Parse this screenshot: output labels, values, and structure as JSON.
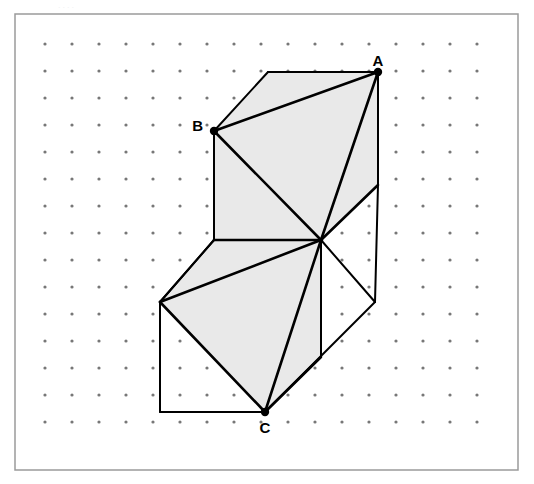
{
  "page": {
    "width": 534,
    "height": 484,
    "background_color": "#ffffff",
    "cropped_header_text": "...."
  },
  "frame": {
    "x": 15,
    "y": 14,
    "width": 503,
    "height": 456,
    "stroke_color": "#9a9a9a",
    "fill_color": "#ffffff",
    "stroke_width": 1.5
  },
  "dot_grid": {
    "origin_x": 45,
    "origin_y": 44,
    "spacing": 27,
    "columns": 17,
    "rows": 15,
    "dot_radius": 1.6,
    "dot_color": "#777777"
  },
  "figure": {
    "line_color": "#000000",
    "shade_color": "#e9e9e9",
    "thin_stroke": 2,
    "thick_stroke": 2.6,
    "vertex_dot_radius": 4.2,
    "points": {
      "A": {
        "x": 378,
        "y": 72
      },
      "B": {
        "x": 214,
        "y": 131
      },
      "C": {
        "x": 265,
        "y": 412
      },
      "M": {
        "x": 321,
        "y": 240
      },
      "topBackLeft": {
        "x": 268,
        "y": 72
      },
      "upperFrontLeftBottom": {
        "x": 214,
        "y": 240
      },
      "upperRightLowerBack": {
        "x": 378,
        "y": 185
      },
      "stepLeftTop": {
        "x": 160,
        "y": 302
      },
      "lowerFrontBottomLeft": {
        "x": 160,
        "y": 412
      },
      "lowerRightBack": {
        "x": 375,
        "y": 302
      },
      "lowerRightBackTop": {
        "x": 375,
        "y": 185
      },
      "lowerBottomRight": {
        "x": 321,
        "y": 357
      }
    },
    "shaded_faces": [
      {
        "name": "upper-top-triangle",
        "polygon": "378,72 268,72 214,131"
      },
      {
        "name": "upper-front-triangle",
        "polygon": "214,131 321,240 214,240"
      },
      {
        "name": "upper-right-triangle",
        "polygon": "378,72 321,240 378,185"
      },
      {
        "name": "upper-diagonal-face",
        "polygon": "378,72 214,131 321,240"
      },
      {
        "name": "lower-top-triangle",
        "polygon": "321,240 214,240 160,302"
      },
      {
        "name": "lower-front-triangle",
        "polygon": "160,302 265,412 265,302"
      },
      {
        "name": "lower-right-triangle",
        "polygon": "321,240 265,412 321,357"
      },
      {
        "name": "lower-diagonal-face",
        "polygon": "321,240 160,302 265,412"
      }
    ]
  },
  "labels": {
    "A": {
      "text": "A",
      "x": 378,
      "y": 66,
      "anchor": "middle"
    },
    "B": {
      "text": "B",
      "x": 203,
      "y": 131,
      "anchor": "end"
    },
    "C": {
      "text": "C",
      "x": 265,
      "y": 433,
      "anchor": "middle"
    }
  }
}
